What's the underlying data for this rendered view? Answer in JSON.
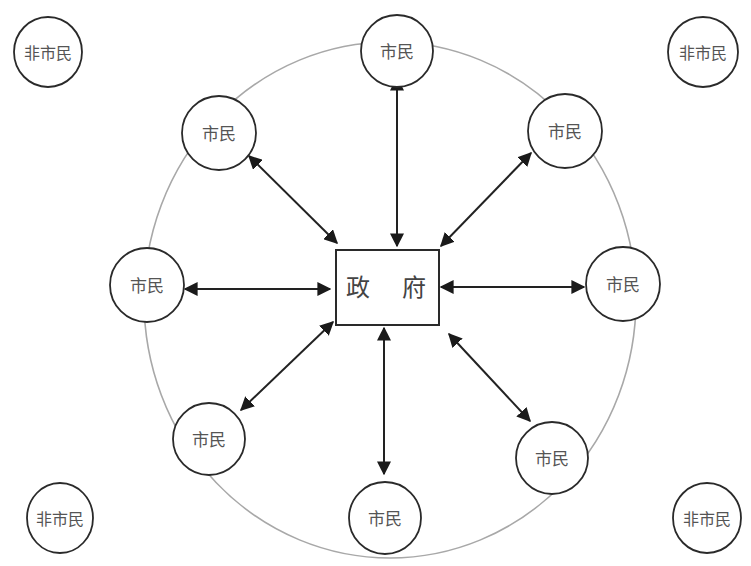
{
  "diagram": {
    "center": {
      "label": "政 府"
    },
    "citizens": [
      {
        "id": "top",
        "label": "市民"
      },
      {
        "id": "top-right",
        "label": "市民"
      },
      {
        "id": "right",
        "label": "市民"
      },
      {
        "id": "bottom-right",
        "label": "市民"
      },
      {
        "id": "bottom",
        "label": "市民"
      },
      {
        "id": "bottom-left",
        "label": "市民"
      },
      {
        "id": "left",
        "label": "市民"
      },
      {
        "id": "top-left",
        "label": "市民"
      }
    ],
    "non_citizens": [
      {
        "id": "top-left-corner",
        "label": "非市民"
      },
      {
        "id": "top-right-corner",
        "label": "非市民"
      },
      {
        "id": "bottom-left-corner",
        "label": "非市民"
      },
      {
        "id": "bottom-right-corner",
        "label": "非市民"
      }
    ],
    "colors": {
      "ring": "#a8a8a8",
      "stroke": "#2a2a2a",
      "text": "#555555"
    }
  }
}
